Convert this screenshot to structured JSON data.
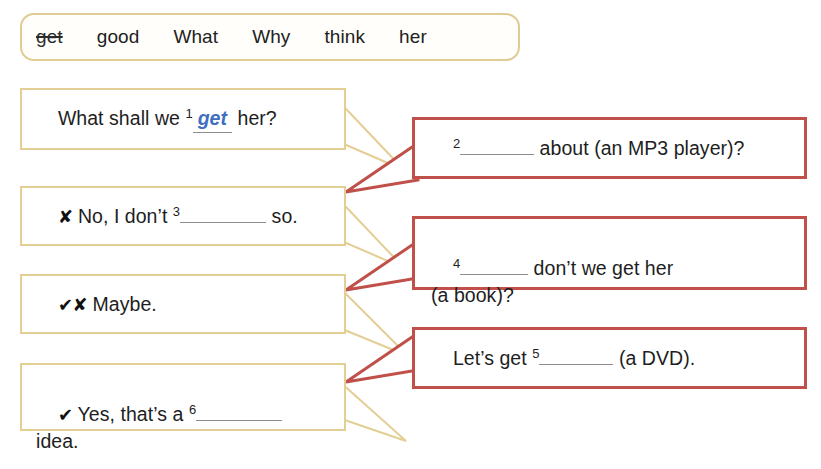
{
  "word_bank": {
    "words": [
      {
        "text": "get",
        "struck": true
      },
      {
        "text": "good",
        "struck": false
      },
      {
        "text": "What",
        "struck": false
      },
      {
        "text": "Why",
        "struck": false
      },
      {
        "text": "think",
        "struck": false
      },
      {
        "text": "her",
        "struck": false
      }
    ]
  },
  "colors": {
    "left_bubble_border": "#e3ce94",
    "right_bubble_border": "#c0504a",
    "answer_text": "#3f6fc0",
    "gap_rule": "#8d8d8d",
    "wordbank_border": "#e0cb92"
  },
  "left_bubbles": [
    {
      "id": "bubble-question-1",
      "mark": "",
      "pre": "What shall we ",
      "gap_number": "1",
      "answer": "get",
      "post": " her?",
      "second_line": ""
    },
    {
      "id": "bubble-reply-no",
      "mark": "✘",
      "pre": " No, I don’t ",
      "gap_number": "3",
      "answer": "",
      "post": " so.",
      "second_line": ""
    },
    {
      "id": "bubble-reply-maybe",
      "mark": "✔✘",
      "pre": " Maybe.",
      "gap_number": "",
      "answer": "",
      "post": "",
      "second_line": ""
    },
    {
      "id": "bubble-reply-yes",
      "mark": "✔",
      "pre": " Yes, that’s a ",
      "gap_number": "6",
      "answer": "",
      "post": "",
      "second_line": "idea."
    }
  ],
  "right_bubbles": [
    {
      "id": "bubble-suggestion-1",
      "gap_number": "2",
      "pre": "",
      "post": " about (an MP3 player)?",
      "second_line": ""
    },
    {
      "id": "bubble-suggestion-2",
      "gap_number": "4",
      "pre": "",
      "post": " don’t we get her",
      "second_line": "(a book)?"
    },
    {
      "id": "bubble-suggestion-3",
      "gap_number": "5",
      "pre": "Let’s get ",
      "post": " (a DVD).",
      "second_line": ""
    }
  ]
}
